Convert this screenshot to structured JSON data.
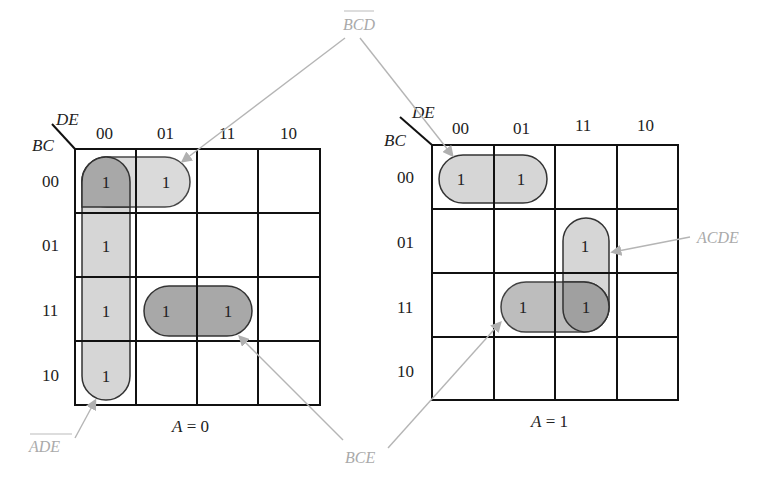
{
  "diagram": {
    "type": "karnaugh-map-5-variable",
    "maps": [
      {
        "id": "A0",
        "caption": "A = 0",
        "row_var": "BC",
        "col_var": "DE",
        "col_labels": [
          "00",
          "01",
          "11",
          "10"
        ],
        "row_labels": [
          "00",
          "01",
          "11",
          "10"
        ],
        "cells": [
          [
            "1",
            "1",
            "",
            ""
          ],
          [
            "1",
            "",
            "",
            ""
          ],
          [
            "1",
            "1",
            "1",
            ""
          ],
          [
            "1",
            "",
            "",
            ""
          ]
        ]
      },
      {
        "id": "A1",
        "caption": "A = 1",
        "row_var": "BC",
        "col_var": "DE",
        "col_labels": [
          "00",
          "01",
          "11",
          "10"
        ],
        "row_labels": [
          "00",
          "01",
          "11",
          "10"
        ],
        "cells": [
          [
            "1",
            "1",
            "",
            ""
          ],
          [
            "",
            "",
            "1",
            ""
          ],
          [
            "",
            "1",
            "1",
            ""
          ],
          [
            "",
            "",
            "",
            ""
          ]
        ]
      }
    ],
    "terms": {
      "bcd": {
        "text": "BCD",
        "overbar": true
      },
      "ade": {
        "text": "ADE",
        "overbar": true
      },
      "bce": {
        "text": "BCE",
        "overbar": false
      },
      "acde": {
        "text": "ACDE",
        "overbar": false
      }
    },
    "colors": {
      "light_group": "#d6d6d6",
      "dark_group": "#a8a8a8",
      "arrow": "#b5b5b5",
      "term_label": "#aaaaaa",
      "grid": "#111111"
    }
  }
}
